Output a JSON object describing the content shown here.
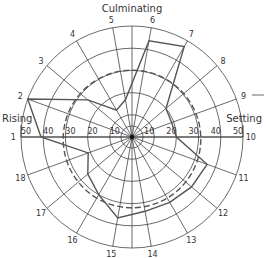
{
  "chart_data": {
    "type": "polar",
    "title": "",
    "labels": {
      "top": "Culminating",
      "left": "Rising",
      "right": "Setting"
    },
    "radial_ticks": [
      10,
      20,
      30,
      40,
      50
    ],
    "rlim": [
      0,
      50
    ],
    "spokes": [
      "1",
      "2",
      "3",
      "4",
      "5",
      "6",
      "7",
      "8",
      "9",
      "10",
      "11",
      "12",
      "13",
      "14",
      "15",
      "16",
      "17",
      "18"
    ],
    "spoke_angles_deg": [
      180,
      160,
      140,
      120,
      100,
      80,
      60,
      40,
      20,
      0,
      -20,
      -40,
      -60,
      -80,
      -100,
      -120,
      -140,
      -160
    ],
    "series": [
      {
        "name": "observed",
        "style": "solid",
        "values": [
          41,
          50,
          26,
          14,
          17,
          44,
          47,
          20,
          19,
          20,
          36,
          35,
          34,
          34,
          37,
          30,
          26,
          21
        ]
      },
      {
        "name": "reference",
        "style": "dashed",
        "values": [
          31,
          31,
          31,
          31,
          31,
          31,
          31,
          31,
          31,
          31,
          31,
          31,
          31,
          31,
          31,
          31,
          31,
          31
        ]
      }
    ],
    "grid": true
  },
  "colors": {
    "grid": "#444444",
    "series": "#555555",
    "text": "#333333"
  }
}
